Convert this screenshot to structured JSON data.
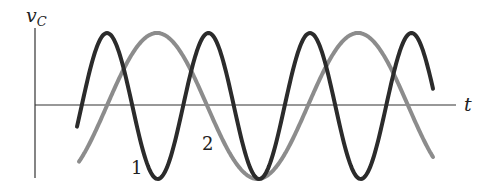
{
  "figure": {
    "y_axis_label": "v",
    "y_axis_subscript": "C",
    "x_axis_label": "t",
    "curve_labels": [
      "1",
      "2"
    ]
  },
  "chart_data": {
    "type": "line",
    "title": "",
    "xlabel": "t",
    "ylabel": "v_C",
    "grid": false,
    "legend": "inline labels near curves",
    "series": [
      {
        "name": "1",
        "color": "#2b2b2b",
        "shape": "sinusoid",
        "relative_period": 1,
        "amplitude": 1,
        "x_range_periods": [
          0,
          3.56
        ]
      },
      {
        "name": "2",
        "color": "#8c8c8c",
        "shape": "sinusoid",
        "relative_period": 2,
        "amplitude": 1,
        "x_range_periods": [
          0,
          3.54
        ]
      }
    ],
    "note": "Curve 1 has half the period (twice the frequency) of curve 2; both share equal amplitude and coincide at a common minimum."
  },
  "colors": {
    "curve1": "#2b2b2b",
    "curve2": "#8c8c8c",
    "axis": "#333333"
  }
}
